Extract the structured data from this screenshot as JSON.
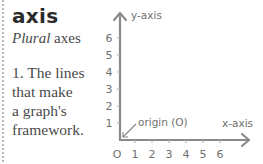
{
  "entry": {
    "term": "axis",
    "plural_label": "Plural",
    "plural_value": "axes",
    "definition_lines": [
      "1. The lines",
      "that make",
      "a graph's",
      "framework."
    ]
  },
  "diagram": {
    "y_axis_label": "y-axis",
    "x_axis_label": "x-axis",
    "origin_label": "origin (O)",
    "y_ticks": [
      "6",
      "5",
      "4",
      "3",
      "2",
      "1"
    ],
    "x_ticks": [
      "O",
      "1",
      "2",
      "3",
      "4",
      "5",
      "6"
    ],
    "axis_color": "#8a8a8a",
    "text_color": "#6f6f6f"
  }
}
